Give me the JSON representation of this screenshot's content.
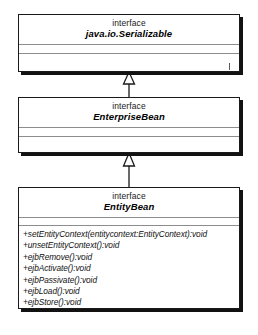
{
  "diagram": {
    "type": "uml-class-diagram",
    "title": "",
    "classes": [
      {
        "id": "serializable",
        "stereotype": "interface",
        "name": "java.io.Serializable",
        "attributes": [],
        "operations": []
      },
      {
        "id": "enterprisebean",
        "stereotype": "interface",
        "name": "EnterpriseBean",
        "attributes": [],
        "operations": []
      },
      {
        "id": "entitybean",
        "stereotype": "interface",
        "name": "EntityBean",
        "attributes": [],
        "operations": [
          "+setEntityContext(entitycontext:EntityContext):void",
          "+unsetEntityContext():void",
          "+ejbRemove():void",
          "+ejbActivate():void",
          "+ejbPassivate():void",
          "+ejbLoad():void",
          "+ejbStore():void"
        ]
      }
    ],
    "relationships": [
      {
        "kind": "generalization",
        "from": "enterprisebean",
        "to": "serializable",
        "arrowhead": "hollow-triangle"
      },
      {
        "kind": "generalization",
        "from": "entitybean",
        "to": "enterprisebean",
        "arrowhead": "hollow-triangle"
      }
    ],
    "colors": {
      "background": "#ffffff",
      "border": "#1a1a1a",
      "shadow": "#121212",
      "divider": "#8d8d8d",
      "text": "#111111"
    }
  }
}
